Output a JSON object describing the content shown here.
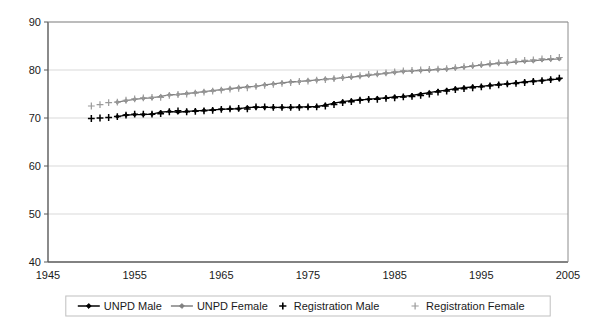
{
  "chart_data": {
    "type": "line",
    "title": "",
    "subtitle": "",
    "xlabel": "",
    "ylabel": "",
    "xlim": [
      1945,
      2005
    ],
    "ylim": [
      40,
      90
    ],
    "xticks": [
      1945,
      1955,
      1965,
      1975,
      1985,
      1995,
      2005
    ],
    "yticks": [
      40,
      50,
      60,
      70,
      80,
      90
    ],
    "grid": "horizontal",
    "legend_position": "bottom",
    "colors": {
      "unpd_male": "#000000",
      "unpd_female": "#808080",
      "registration_male": "#000000",
      "registration_female": "#9a9a9a",
      "gridline": "#d9d9d9",
      "axis": "#595959",
      "plot_background": "#ffffff"
    },
    "x": [
      1950,
      1951,
      1952,
      1953,
      1954,
      1955,
      1956,
      1957,
      1958,
      1959,
      1960,
      1961,
      1962,
      1963,
      1964,
      1965,
      1966,
      1967,
      1968,
      1969,
      1970,
      1971,
      1972,
      1973,
      1974,
      1975,
      1976,
      1977,
      1978,
      1979,
      1980,
      1981,
      1982,
      1983,
      1984,
      1985,
      1986,
      1987,
      1988,
      1989,
      1990,
      1991,
      1992,
      1993,
      1994,
      1995,
      1996,
      1997,
      1998,
      1999,
      2000,
      2001,
      2002,
      2003,
      2004
    ],
    "series": [
      {
        "name": "UNPD Male",
        "marker": "diamond",
        "line": true,
        "color": "#000000",
        "x": [
          1953,
          1954,
          1955,
          1956,
          1957,
          1958,
          1959,
          1960,
          1961,
          1962,
          1963,
          1964,
          1965,
          1966,
          1967,
          1968,
          1969,
          1970,
          1971,
          1972,
          1973,
          1974,
          1975,
          1976,
          1977,
          1978,
          1979,
          1980,
          1981,
          1982,
          1983,
          1984,
          1985,
          1986,
          1987,
          1988,
          1989,
          1990,
          1991,
          1992,
          1993,
          1994,
          1995,
          1996,
          1997,
          1998,
          1999,
          2000,
          2001,
          2002,
          2003,
          2004
        ],
        "values": [
          70.3,
          70.6,
          70.7,
          70.7,
          70.8,
          71.2,
          71.4,
          71.2,
          71.4,
          71.5,
          71.6,
          71.7,
          71.8,
          71.9,
          71.9,
          72.2,
          72.2,
          72.2,
          72.2,
          72.2,
          72.2,
          72.3,
          72.3,
          72.4,
          72.7,
          73.1,
          73.4,
          73.6,
          73.8,
          73.9,
          74.1,
          74.2,
          74.4,
          74.5,
          74.7,
          75.0,
          75.3,
          75.6,
          75.8,
          76.1,
          76.3,
          76.5,
          76.6,
          76.8,
          77.0,
          77.1,
          77.3,
          77.5,
          77.7,
          77.8,
          78.0,
          78.1
        ]
      },
      {
        "name": "UNPD Female",
        "marker": "diamond",
        "line": true,
        "color": "#808080",
        "x": [
          1953,
          1954,
          1955,
          1956,
          1957,
          1958,
          1959,
          1960,
          1961,
          1962,
          1963,
          1964,
          1965,
          1966,
          1967,
          1968,
          1969,
          1970,
          1971,
          1972,
          1973,
          1974,
          1975,
          1976,
          1977,
          1978,
          1979,
          1980,
          1981,
          1982,
          1983,
          1984,
          1985,
          1986,
          1987,
          1988,
          1989,
          1990,
          1991,
          1992,
          1993,
          1994,
          1995,
          1996,
          1997,
          1998,
          1999,
          2000,
          2001,
          2002,
          2003,
          2004
        ],
        "values": [
          73.3,
          73.6,
          73.9,
          74.1,
          74.2,
          74.5,
          74.8,
          74.9,
          75.1,
          75.3,
          75.5,
          75.7,
          75.9,
          76.1,
          76.3,
          76.5,
          76.6,
          76.9,
          77.1,
          77.3,
          77.5,
          77.6,
          77.8,
          77.9,
          78.1,
          78.2,
          78.4,
          78.5,
          78.7,
          78.9,
          79.1,
          79.3,
          79.5,
          79.7,
          79.8,
          79.9,
          80.0,
          80.1,
          80.2,
          80.4,
          80.6,
          80.8,
          81.0,
          81.2,
          81.4,
          81.5,
          81.7,
          81.8,
          81.9,
          82.1,
          82.2,
          82.3
        ]
      },
      {
        "name": "Registration Male",
        "marker": "plus",
        "line": false,
        "color": "#000000",
        "x": [
          1950,
          1951,
          1952,
          1953,
          1954,
          1955,
          1956,
          1957,
          1958,
          1959,
          1960,
          1961,
          1962,
          1963,
          1964,
          1965,
          1966,
          1967,
          1968,
          1969,
          1970,
          1971,
          1972,
          1973,
          1974,
          1975,
          1976,
          1977,
          1978,
          1979,
          1980,
          1981,
          1982,
          1983,
          1984,
          1985,
          1986,
          1987,
          1988,
          1989,
          1990,
          1991,
          1992,
          1993,
          1994,
          1995,
          1996,
          1997,
          1998,
          1999,
          2000,
          2001,
          2002,
          2003,
          2004
        ],
        "values": [
          69.9,
          70.0,
          70.1,
          70.3,
          70.6,
          70.8,
          70.8,
          70.8,
          70.9,
          71.3,
          71.5,
          71.3,
          71.4,
          71.5,
          71.6,
          71.8,
          71.9,
          72.0,
          71.9,
          72.3,
          72.3,
          72.2,
          72.2,
          72.2,
          72.2,
          72.3,
          72.3,
          72.5,
          72.8,
          73.2,
          73.4,
          73.7,
          73.9,
          73.9,
          74.1,
          74.2,
          74.4,
          74.5,
          74.7,
          75.0,
          75.4,
          75.6,
          75.9,
          76.1,
          76.3,
          76.5,
          76.7,
          76.9,
          77.1,
          77.2,
          77.4,
          77.6,
          77.8,
          78.0,
          78.3
        ]
      },
      {
        "name": "Registration Female",
        "marker": "plus",
        "line": false,
        "color": "#9a9a9a",
        "x": [
          1950,
          1951,
          1952,
          1953,
          1954,
          1955,
          1956,
          1957,
          1958,
          1959,
          1960,
          1961,
          1962,
          1963,
          1964,
          1965,
          1966,
          1967,
          1968,
          1969,
          1970,
          1971,
          1972,
          1973,
          1974,
          1975,
          1976,
          1977,
          1978,
          1979,
          1980,
          1981,
          1982,
          1983,
          1984,
          1985,
          1986,
          1987,
          1988,
          1989,
          1990,
          1991,
          1992,
          1993,
          1994,
          1995,
          1996,
          1997,
          1998,
          1999,
          2000,
          2001,
          2002,
          2003,
          2004
        ],
        "values": [
          72.5,
          72.8,
          73.2,
          73.3,
          73.7,
          74.0,
          74.2,
          74.3,
          74.3,
          74.7,
          74.9,
          75.0,
          75.2,
          75.4,
          75.6,
          75.8,
          76.0,
          76.2,
          76.3,
          76.6,
          76.8,
          77.0,
          77.2,
          77.4,
          77.6,
          77.7,
          77.9,
          78.0,
          78.2,
          78.4,
          78.6,
          78.8,
          79.1,
          79.2,
          79.4,
          79.6,
          79.8,
          79.9,
          80.0,
          80.1,
          80.2,
          80.3,
          80.5,
          80.7,
          80.9,
          81.1,
          81.3,
          81.5,
          81.6,
          81.8,
          82.0,
          82.1,
          82.3,
          82.4,
          82.6
        ]
      }
    ],
    "legend": [
      {
        "label": "UNPD Male",
        "marker": "line-diamond",
        "color": "#000000"
      },
      {
        "label": "UNPD Female",
        "marker": "line-diamond",
        "color": "#808080"
      },
      {
        "label": "Registration Male",
        "marker": "plus",
        "color": "#000000"
      },
      {
        "label": "Registration Female",
        "marker": "plus",
        "color": "#9a9a9a"
      }
    ]
  }
}
